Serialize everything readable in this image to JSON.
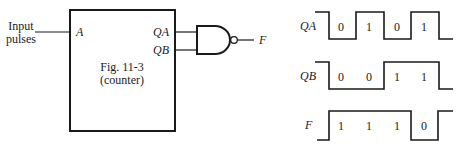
{
  "circuit": {
    "input_label_line1": "Input",
    "input_label_line2": "pulses",
    "pin_a": "A",
    "pin_qa": "QA",
    "pin_qb": "QB",
    "box_title_line1": "Fig. 11-3",
    "box_title_line2": "(counter)",
    "gate_type": "NAND",
    "output_label": "F"
  },
  "waveforms": {
    "qa": {
      "label": "QA",
      "bits": [
        "0",
        "1",
        "0",
        "1"
      ]
    },
    "qb": {
      "label": "QB",
      "bits": [
        "0",
        "0",
        "1",
        "1"
      ]
    },
    "f": {
      "label": "F",
      "bits": [
        "1",
        "1",
        "1",
        "0"
      ]
    }
  },
  "colors": {
    "line": "#1a1a1a",
    "background": "#ffffff"
  }
}
